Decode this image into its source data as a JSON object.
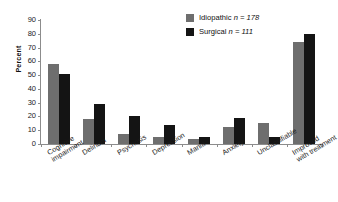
{
  "chart_data": {
    "type": "bar",
    "title": "",
    "xlabel": "",
    "ylabel": "Percent",
    "ylim": [
      0,
      90
    ],
    "ytick_step": 10,
    "yticks": [
      90,
      80,
      70,
      60,
      50,
      40,
      30,
      20,
      10,
      0
    ],
    "grid": false,
    "legend_position": "top-right",
    "categories": [
      "Cognitive impairment",
      "Delirium",
      "Psychosis",
      "Depression",
      "Mania",
      "Anxiety",
      "Unclassifiable",
      "Improved with treatment"
    ],
    "category_lines": [
      [
        "Cognitive",
        "impairment"
      ],
      [
        "Delirium"
      ],
      [
        "Psychosis"
      ],
      [
        "Depression"
      ],
      [
        "Mania"
      ],
      [
        "Anxiety"
      ],
      [
        "Unclassifiable"
      ],
      [
        "Improved",
        "with treatment"
      ]
    ],
    "series": [
      {
        "name": "Idiopathic",
        "n": 178,
        "legend_label": "Idiopathic n = 178",
        "color": "#6e6e6e",
        "values": [
          58,
          18,
          7,
          5,
          4,
          12,
          15,
          74
        ]
      },
      {
        "name": "Surgical",
        "n": 111,
        "legend_label": "Surgical n = 111",
        "color": "#141414",
        "values": [
          51,
          29,
          20,
          14,
          5,
          19,
          5,
          80
        ]
      }
    ]
  },
  "axis": {
    "y_label": "Percent",
    "y_tick_labels": [
      "90",
      "80",
      "70",
      "60",
      "50",
      "40",
      "30",
      "20",
      "10",
      "0"
    ]
  },
  "legend": {
    "entries": [
      {
        "label": "Idiopathic",
        "stat": "n = 178",
        "swatch": "#6e6e6e"
      },
      {
        "label": "Surgical",
        "stat": "n = 111",
        "swatch": "#141414"
      }
    ]
  },
  "colors": {
    "idiopathic": "#6e6e6e",
    "surgical": "#141414",
    "axis": "#8c8c8c",
    "background": "#ffffff"
  }
}
